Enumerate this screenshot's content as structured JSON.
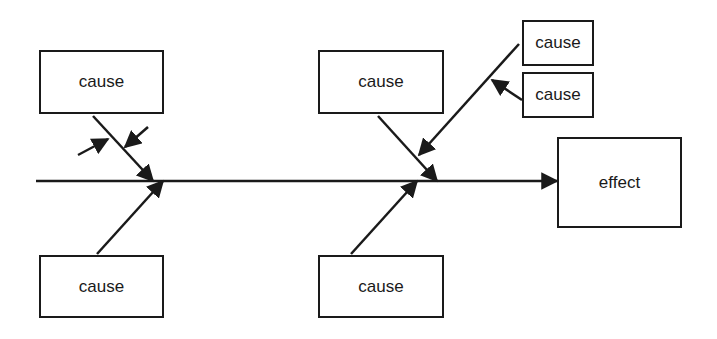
{
  "diagram": {
    "type": "fishbone",
    "effect": {
      "label": "effect"
    },
    "causes": [
      {
        "id": "top-left",
        "label": "cause"
      },
      {
        "id": "bottom-left",
        "label": "cause"
      },
      {
        "id": "top-middle",
        "label": "cause"
      },
      {
        "id": "bottom-middle",
        "label": "cause"
      },
      {
        "id": "sub-cause-upper",
        "label": "cause"
      },
      {
        "id": "sub-cause-lower",
        "label": "cause"
      }
    ],
    "colors": {
      "line": "#1a1a1a",
      "background": "#ffffff"
    }
  }
}
